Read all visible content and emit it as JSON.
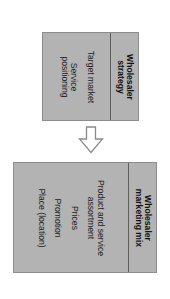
{
  "diagram": {
    "orientation": "rotated-90-clockwise",
    "colors": {
      "box_fill": "#b3b3b3",
      "box_border": "#8c8c8c",
      "divider": "#5e5e5e",
      "text": "#222222",
      "arrow_stroke": "#8a8a8a",
      "background": "#ffffff"
    },
    "top_box": {
      "title": "Wholesaler strategy",
      "title_lines": [
        "Wholesaler",
        "strategy"
      ],
      "items": [
        "Target market",
        "Service positioning"
      ],
      "item_lines": [
        [
          "Target market"
        ],
        [
          "Service",
          "positioning"
        ]
      ]
    },
    "arrow": {
      "icon": "hollow-down-arrow-icon",
      "direction": "down"
    },
    "bottom_box": {
      "title": "Wholesaler marketing mix",
      "title_lines": [
        "Wholesaler",
        "marketing mix"
      ],
      "items": [
        "Product and service assortment",
        "Prices",
        "Promotion",
        "Place (location)"
      ],
      "item_lines": [
        [
          "Product and service",
          "assortment"
        ],
        [
          "Prices"
        ],
        [
          "Promotion"
        ],
        [
          "Place (location)"
        ]
      ]
    }
  }
}
